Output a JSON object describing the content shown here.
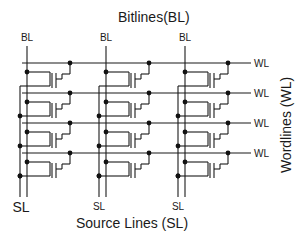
{
  "diagram": {
    "title": "Bitlines(BL)",
    "bottom_title": "Source Lines (SL)",
    "side_title": "Wordlines (WL)",
    "columns": [
      {
        "bl_label": "BL",
        "sl_label": "SL"
      },
      {
        "bl_label": "BL",
        "sl_label": "SL"
      },
      {
        "bl_label": "BL",
        "sl_label": "SL"
      }
    ],
    "rows": [
      {
        "wl_label": "WL"
      },
      {
        "wl_label": "WL"
      },
      {
        "wl_label": "WL"
      },
      {
        "wl_label": "WL"
      }
    ],
    "cell_count": 12,
    "colors": {
      "line": "#1a1a1a",
      "background": "#ffffff"
    }
  }
}
